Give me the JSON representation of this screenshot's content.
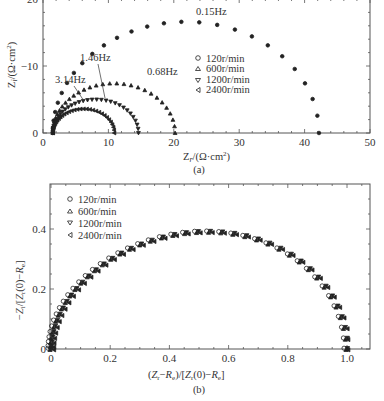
{
  "chart_data": [
    {
      "id": "a",
      "type": "scatter",
      "title": "",
      "caption": "(a)",
      "xlabel": "Zr/(Ω·cm²)",
      "ylabel": "Zi/(Ω·cm²)",
      "xlim": [
        0,
        50
      ],
      "ylim": [
        0,
        -20
      ],
      "xticks": [
        "0",
        "10",
        "20",
        "30",
        "40",
        "50"
      ],
      "yticks": [
        "0",
        "-10",
        "-20"
      ],
      "grid": false,
      "legend_position": "upper right inside",
      "legend": [
        "120r/min",
        "600r/min",
        "1200r/min",
        "2400r/min"
      ],
      "annotations": [
        {
          "text": "0.15Hz",
          "x": 26,
          "y": -18.5
        },
        {
          "text": "0.68Hz",
          "x": 16,
          "y": -9.5
        },
        {
          "text": "1.46Hz",
          "x": 9,
          "y": -11.3
        },
        {
          "text": "3.14Hz",
          "x": 6,
          "y": -8.5
        }
      ],
      "series": [
        {
          "name": "120r/min",
          "marker": "circle",
          "r_start": 1.5,
          "r_end": 42.2,
          "peak_x": 26,
          "peak_y": -16.6,
          "apex_freq": "0.15Hz"
        },
        {
          "name": "600r/min",
          "marker": "triangle-up",
          "r_start": 1.5,
          "r_end": 20.2,
          "peak_x": 13.5,
          "peak_y": -7.4,
          "apex_freq": "0.68Hz"
        },
        {
          "name": "1200r/min",
          "marker": "triangle-down",
          "r_start": 1.5,
          "r_end": 14.6,
          "peak_x": 9.5,
          "peak_y": -5.0,
          "apex_freq": "1.46Hz"
        },
        {
          "name": "2400r/min",
          "marker": "triangle-left",
          "r_start": 1.5,
          "r_end": 10.9,
          "peak_x": 7.0,
          "peak_y": -3.6,
          "apex_freq": "3.14Hz"
        }
      ]
    },
    {
      "id": "b",
      "type": "scatter",
      "title": "",
      "caption": "(b)",
      "xlabel": "(Zr−Re)/[Zr(0)−Re]",
      "ylabel": "−Zi/[Zr(0)−Re]",
      "xlim": [
        0,
        1.1
      ],
      "ylim": [
        0,
        0.55
      ],
      "xticks": [
        "0",
        "0.2",
        "0.4",
        "0.6",
        "0.8",
        "1.0"
      ],
      "yticks": [
        "0",
        "0.2",
        "0.4"
      ],
      "grid": false,
      "legend_position": "upper left inside",
      "legend": [
        "120r/min",
        "600r/min",
        "1200r/min",
        "2400r/min"
      ],
      "series_note": "All four series overlap on a single normalized depressed semicircle from (0,0) to (1.0,0) with peak about 0.39 at x≈0.6",
      "series": [
        {
          "name": "120r/min",
          "marker": "circle",
          "peak_x": 0.6,
          "peak_y": 0.39
        },
        {
          "name": "600r/min",
          "marker": "triangle-up",
          "peak_x": 0.6,
          "peak_y": 0.39
        },
        {
          "name": "1200r/min",
          "marker": "triangle-down",
          "peak_x": 0.6,
          "peak_y": 0.39
        },
        {
          "name": "2400r/min",
          "marker": "triangle-left",
          "peak_x": 0.6,
          "peak_y": 0.39
        }
      ]
    }
  ],
  "labels": {
    "a_caption": "(a)",
    "b_caption": "(b)",
    "a_xlabel": "Zr/(Ω·cm²)",
    "a_ylabel": "Zi/(Ω·cm²)",
    "b_xlabel": "(Zr−Re)/[Zr(0)−Re]",
    "b_ylabel": "−Zi/[Zr(0)−Re]",
    "ann_015": "0.15Hz",
    "ann_068": "0.68Hz",
    "ann_146": "1.46Hz",
    "ann_314": "3.14Hz",
    "legend": [
      "120r/min",
      "600r/min",
      "1200r/min",
      "2400r/min"
    ],
    "a_xticks": [
      "0",
      "10",
      "20",
      "30",
      "40",
      "50"
    ],
    "a_yticks": [
      "0",
      "−10",
      "−20"
    ],
    "b_xticks": [
      "0",
      "0.2",
      "0.4",
      "0.6",
      "0.8",
      "1.0"
    ],
    "b_yticks": [
      "0",
      "0.2",
      "0.4"
    ]
  }
}
